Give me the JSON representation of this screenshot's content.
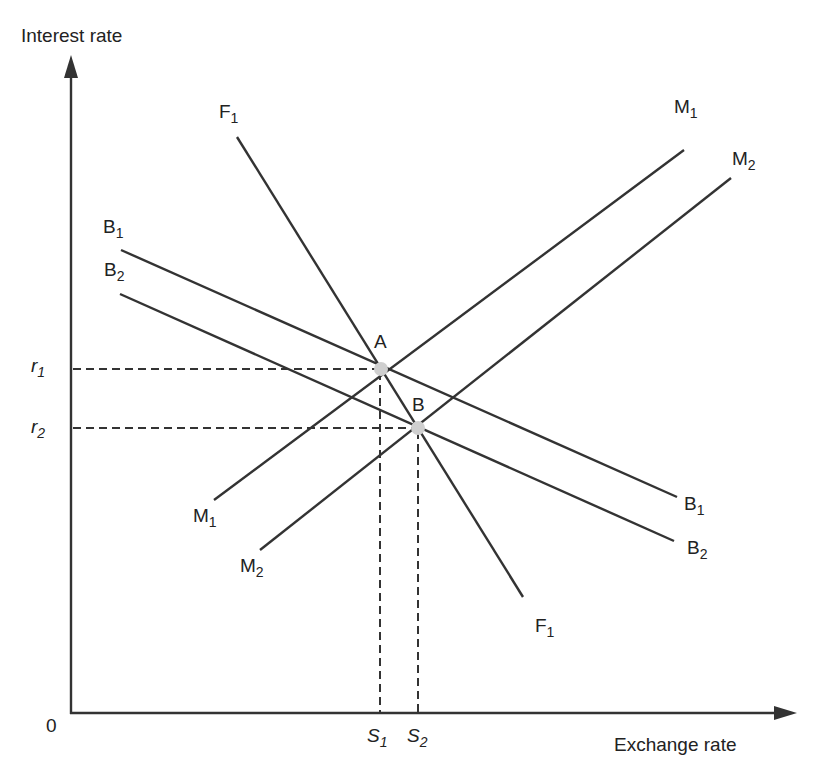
{
  "diagram": {
    "type": "economics-equilibrium-diagram",
    "axes": {
      "y_label": "Interest rate",
      "x_label": "Exchange rate",
      "origin_label": "0"
    },
    "y_ticks": [
      {
        "base": "r",
        "sub": "1"
      },
      {
        "base": "r",
        "sub": "2"
      }
    ],
    "x_ticks": [
      {
        "base": "S",
        "sub": "1"
      },
      {
        "base": "S",
        "sub": "2"
      }
    ],
    "curves": [
      {
        "id": "F1",
        "base": "F",
        "sub": "1",
        "direction": "steep downward"
      },
      {
        "id": "M1",
        "base": "M",
        "sub": "1",
        "direction": "upward"
      },
      {
        "id": "M2",
        "base": "M",
        "sub": "2",
        "direction": "upward, shifted right"
      },
      {
        "id": "B1",
        "base": "B",
        "sub": "1",
        "direction": "gentle downward"
      },
      {
        "id": "B2",
        "base": "B",
        "sub": "2",
        "direction": "gentle downward, shifted down"
      }
    ],
    "points": [
      {
        "label": "A",
        "on": [
          "F1",
          "M1",
          "B1"
        ],
        "x_value": "S1",
        "y_value": "r1"
      },
      {
        "label": "B",
        "on": [
          "F1",
          "M2",
          "B2"
        ],
        "x_value": "S2",
        "y_value": "r2"
      }
    ],
    "colors": {
      "line": "#333333",
      "point": "#cfcfcf",
      "background": "#ffffff"
    }
  }
}
